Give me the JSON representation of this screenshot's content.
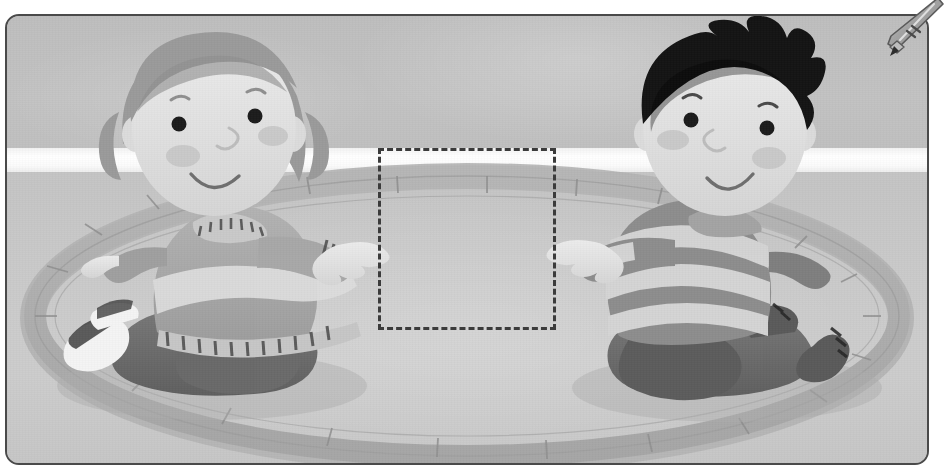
{
  "page": {
    "kind": "worksheet-illustration",
    "width": 938,
    "height": 468,
    "palette": {
      "frame_border": "#4a4a4a",
      "wall": "#bfbfbf",
      "floor": "#c8c8c8",
      "baseboard_band": "#ffffff",
      "ring_fill": "#b0b0b0",
      "ring_shadow": "#a0a0a0",
      "skin": "#e2e2e2",
      "skin_shadow": "#c9c9c9",
      "hair_girl": "#9b9b9b",
      "hair_boy": "#141414",
      "ink": "#3b3b3b",
      "dash_stroke": "#3b3b3b",
      "girl_shirt": "#a9a9a9",
      "girl_band": "#d8d8d8",
      "girl_pants": "#6f6f6f",
      "boy_shirt_dark": "#8d8d8d",
      "boy_shirt_light": "#d4d4d4",
      "boy_pants": "#666666",
      "shoe_white": "#f2f2f2",
      "cheek": "#c7c7c7"
    }
  },
  "frame": {
    "label": "illustration-frame",
    "corner_radius": "14px",
    "border_width": "2px"
  },
  "pencil": {
    "label": "pencil",
    "icon": "pencil-icon",
    "tip_target": "frame-top-right-corner",
    "body_color": "#9a9a9a",
    "tip_color": "#2e2e2e"
  },
  "answer_box": {
    "label": "answer-placeholder",
    "style": "dashed",
    "value": "",
    "placeholder": "",
    "x": 371,
    "y": 132,
    "width": 172,
    "height": 176
  },
  "scene": {
    "title": "Two children kneeling facing each other across a ring on the floor",
    "background": {
      "wall_label": "back-wall",
      "baseboard_label": "white-baseboard-band",
      "floor_label": "floor"
    },
    "ring": {
      "label": "segmented-floor-ring",
      "segments": 22,
      "center_x": 460,
      "center_y": 300,
      "radius_x": 432,
      "radius_y": 140
    },
    "characters": [
      {
        "id": "girl",
        "label": "girl-character",
        "side": "left",
        "hair": "shoulder-length with bangs",
        "expression": "smiling",
        "clothing": "long-sleeve shirt with light band and striped cuffs, dark trousers, white sneakers",
        "pose": "kneeling, reaching right hand toward the center"
      },
      {
        "id": "boy",
        "label": "boy-character",
        "side": "right",
        "hair": "black spiky",
        "expression": "smiling",
        "clothing": "wide horizontal striped long-sleeve shirt, dark trousers, dark shoes",
        "pose": "kneeling, reaching left hand toward the center"
      }
    ]
  }
}
